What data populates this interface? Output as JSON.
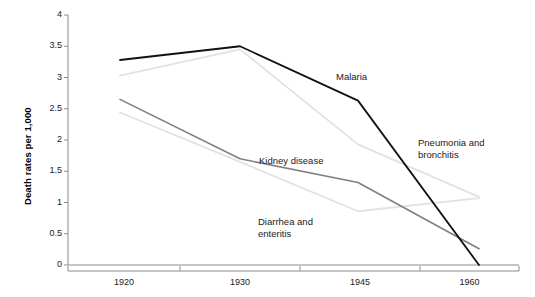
{
  "chart_data": {
    "type": "line",
    "title": "",
    "xlabel": "",
    "ylabel": "Death rates per 1,000",
    "categories": [
      "1920",
      "1930",
      "1945",
      "1960"
    ],
    "x_tick_labels": [
      "1920",
      "1930",
      "1945",
      "1960"
    ],
    "y_tick_labels": [
      "0",
      "0.5",
      "1",
      "1.5",
      "2",
      "2.5",
      "3",
      "3.5",
      "4"
    ],
    "y_ticks": [
      0,
      0.5,
      1,
      1.5,
      2,
      2.5,
      3,
      3.5,
      4
    ],
    "ylim": [
      0,
      4
    ],
    "grid": false,
    "legend": "inline-annotations",
    "series": [
      {
        "name": "Malaria",
        "color": "#111111",
        "width": 1.8,
        "values": [
          3.28,
          3.5,
          2.63,
          0.0
        ]
      },
      {
        "name": "Pneumonia and bronchitis",
        "color": "#e2e2e2",
        "width": 1.8,
        "values": [
          3.03,
          3.45,
          1.93,
          1.09
        ]
      },
      {
        "name": "Kidney disease",
        "color": "#808080",
        "width": 1.6,
        "values": [
          2.65,
          1.7,
          1.32,
          0.26
        ]
      },
      {
        "name": "Diarrhea and enteritis",
        "color": "#e2e2e2",
        "width": 1.8,
        "values": [
          2.44,
          1.65,
          0.86,
          1.07
        ]
      }
    ],
    "annotations": [
      {
        "text": "Malaria",
        "lines": [
          "Malaria"
        ],
        "x": 336,
        "y": 71
      },
      {
        "text": "Pneumonia and bronchitis",
        "lines": [
          "Pneumonia and",
          "bronchitis"
        ],
        "x": 418,
        "y": 137
      },
      {
        "text": "Kidney disease",
        "lines": [
          "Kidney disease"
        ],
        "x": 259,
        "y": 155
      },
      {
        "text": "Diarrhea and enteritis",
        "lines": [
          "Diarrhea and",
          "enteritis"
        ],
        "x": 258,
        "y": 216
      }
    ],
    "axis_color": "#8c8c8c"
  }
}
